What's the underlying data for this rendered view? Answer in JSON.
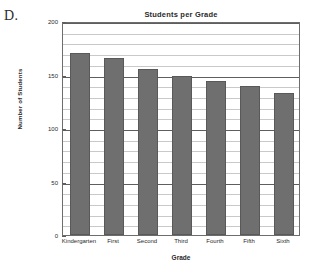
{
  "figure": {
    "label": "D."
  },
  "chart_data": {
    "type": "bar",
    "title": "Students per Grade",
    "xlabel": "Grade",
    "ylabel": "Number of Students",
    "categories": [
      "Kindergarten",
      "First",
      "Second",
      "Third",
      "Fourth",
      "Fifth",
      "Sixth"
    ],
    "values": [
      170,
      165,
      155,
      149,
      144,
      139,
      133
    ],
    "ylim": [
      0,
      200
    ],
    "ytick_labels": [
      "0",
      "50",
      "100",
      "150",
      "200"
    ],
    "ytick_values": [
      0,
      50,
      100,
      150,
      200
    ],
    "minor_tick_step": 10,
    "grid": true,
    "legend": false,
    "bar_color": "#706f70",
    "bar_border_color": "#5a595a",
    "major_gridline_color": "#5e5e5e",
    "minor_gridline_color": "#c9c9c9",
    "frame_color": "#6d6d6d"
  }
}
